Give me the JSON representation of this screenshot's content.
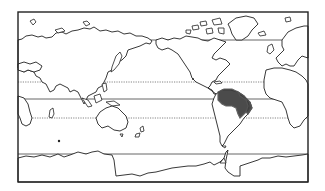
{
  "map": {
    "type": "world-outline-map",
    "projection": "equirectangular, Pacific-centered",
    "frame": {
      "x": 18,
      "y": 12,
      "width": 290,
      "height": 170
    },
    "reference_lines": [
      {
        "name": "arctic-circle",
        "style": "solid",
        "y": 40
      },
      {
        "name": "tropic-of-cancer",
        "style": "dotted",
        "y": 82
      },
      {
        "name": "equator",
        "style": "solid",
        "y": 99
      },
      {
        "name": "tropic-of-capricorn",
        "style": "dotted",
        "y": 118
      },
      {
        "name": "antarctic-circle",
        "style": "solid",
        "y": 154
      }
    ],
    "highlighted_region": {
      "name": "distribution-range",
      "location": "northern South America (Amazon basin)",
      "color": "#3c3c3c"
    },
    "colors": {
      "land": "#ffffff",
      "outline": "#222222",
      "background": "#ffffff"
    }
  },
  "labels": {
    "caption": "Distribution range map"
  }
}
